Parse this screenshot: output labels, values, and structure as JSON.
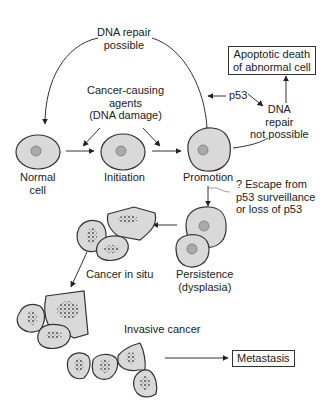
{
  "diagram": {
    "labels": {
      "dna_repair_possible": [
        "DNA repair",
        "possible"
      ],
      "cancer_causing_agents": [
        "Cancer-causing",
        "agents",
        "(DNA damage)"
      ],
      "p53": "p53",
      "dna_repair_not_possible": [
        "DNA",
        "repair",
        "not possible"
      ],
      "normal_cell": [
        "Normal",
        "cell"
      ],
      "initiation": "Initiation",
      "promotion": "Promotion",
      "escape": [
        "? Escape from",
        "p53 surveillance",
        "or loss of p53"
      ],
      "persistence": [
        "Persistence",
        "(dysplasia)"
      ],
      "cancer_in_situ": "Cancer in situ",
      "invasive_cancer": "Invasive cancer"
    },
    "boxes": {
      "apoptotic_death": [
        "Apoptotic death",
        "of abnormal cell"
      ],
      "metastasis": "Metastasis"
    },
    "colors": {
      "cell_fill": "#d9d9d9",
      "stroke": "#333333",
      "background": "#ffffff"
    }
  }
}
